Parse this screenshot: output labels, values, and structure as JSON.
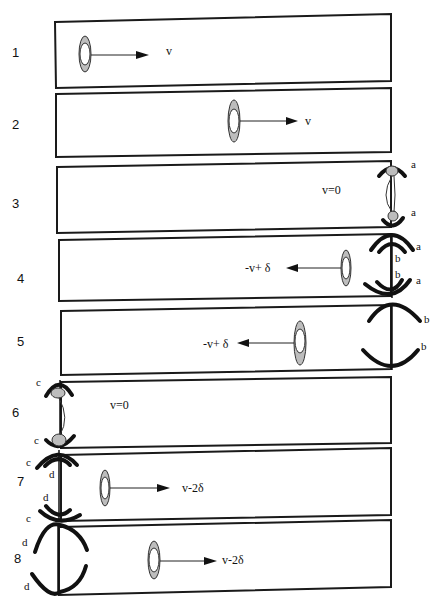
{
  "figure": {
    "type": "sequence diagram of a particle in a box bouncing between moving mirrors",
    "colors": {
      "line": "#111111",
      "particle_fill": "#bdbdbd",
      "background": "#ffffff"
    }
  },
  "frames": [
    {
      "index": "1",
      "velocity_label": "v",
      "direction": "right",
      "mirror_side": "none"
    },
    {
      "index": "2",
      "velocity_label": "v",
      "direction": "right",
      "mirror_side": "none"
    },
    {
      "index": "3",
      "velocity_label": "v=0",
      "direction": "none",
      "mirror_side": "right",
      "mirror_labels": [
        "a",
        "a"
      ]
    },
    {
      "index": "4",
      "velocity_label": "-v+ δ",
      "direction": "left",
      "mirror_side": "right",
      "mirror_labels": [
        "a",
        "b",
        "b",
        "a"
      ]
    },
    {
      "index": "5",
      "velocity_label": "-v+ δ",
      "direction": "left",
      "mirror_side": "right",
      "mirror_labels": [
        "b",
        "b"
      ]
    },
    {
      "index": "6",
      "velocity_label": "v=0",
      "direction": "none",
      "mirror_side": "left",
      "mirror_labels": [
        "c",
        "c"
      ]
    },
    {
      "index": "7",
      "velocity_label": "v-2δ",
      "direction": "right",
      "mirror_side": "left",
      "mirror_labels": [
        "c",
        "d",
        "d",
        "c"
      ]
    },
    {
      "index": "8",
      "velocity_label": "v-2δ",
      "direction": "right",
      "mirror_side": "left",
      "mirror_labels": [
        "d",
        "d"
      ]
    }
  ]
}
